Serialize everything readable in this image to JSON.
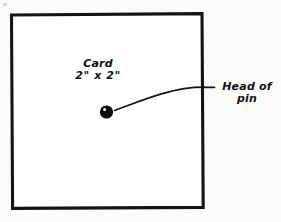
{
  "figure": {
    "background_color": "#fbfbfa",
    "ink_color": "#111111"
  },
  "card": {
    "name": "card-outline",
    "shape": "square",
    "label_line1": "Card",
    "label_line2": "2\" x 2\"",
    "width_label": "2\"",
    "height_label": "2\""
  },
  "pin": {
    "name": "pin-head",
    "marker": "filled-circle-with-highlight",
    "label_line1": "Head of",
    "label_line2": "pin"
  },
  "leader": {
    "name": "leader-line",
    "description": "curved line from pin head to label"
  }
}
